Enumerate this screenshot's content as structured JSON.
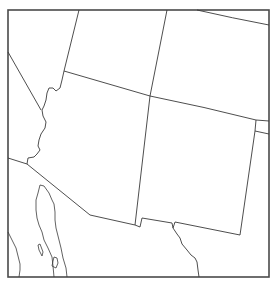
{
  "map": {
    "region": "Southwestern United States",
    "style": {
      "background": "#ffffff",
      "line_color": "#3a3a3a",
      "frame_color": "#4a4a4a"
    },
    "frame": {
      "x": 8,
      "y": 10,
      "width": 261,
      "height": 267
    },
    "regions": [
      {
        "name": "Nevada"
      },
      {
        "name": "California"
      },
      {
        "name": "Utah"
      },
      {
        "name": "Colorado"
      },
      {
        "name": "Arizona"
      },
      {
        "name": "New Mexico"
      },
      {
        "name": "Oklahoma panhandle"
      },
      {
        "name": "Texas"
      },
      {
        "name": "Mexico"
      },
      {
        "name": "Baja California"
      },
      {
        "name": "Gulf of California"
      }
    ]
  }
}
